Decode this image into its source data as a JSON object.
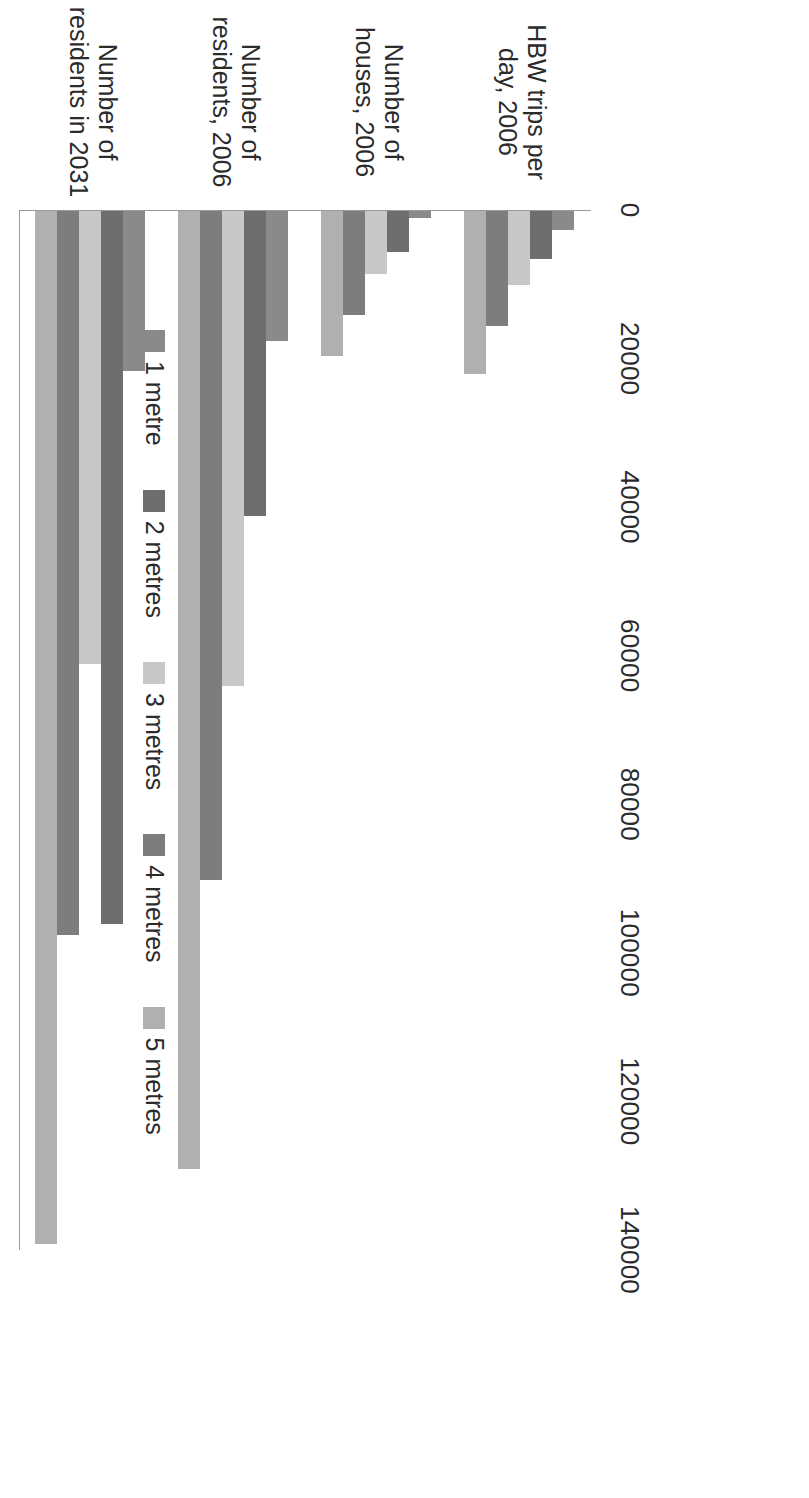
{
  "chart_data": {
    "type": "bar",
    "orientation": "vertical-clustered",
    "title": "",
    "subtitle": "",
    "xlabel": "",
    "ylabel": "",
    "ylim": [
      0,
      140000
    ],
    "grid": false,
    "legend_position": "bottom",
    "tick_labels": [
      "0",
      "20000",
      "40000",
      "60000",
      "80000",
      "100000",
      "120000",
      "140000"
    ],
    "ticks": [
      0,
      20000,
      40000,
      60000,
      80000,
      100000,
      120000,
      140000
    ],
    "categories": [
      "HBW trips per day, 2006",
      "Number of houses, 2006",
      "Number of residents, 2006",
      "Number of residents in 2031"
    ],
    "series": [
      {
        "name": "1 metre",
        "color": "#8a8a8a",
        "values": [
          2500,
          1000,
          17500,
          21500
        ]
      },
      {
        "name": "2 metres",
        "color": "#6e6e6e",
        "values": [
          6500,
          5500,
          41000,
          96000
        ]
      },
      {
        "name": "3 metres",
        "color": "#c8c8c8",
        "values": [
          10000,
          8500,
          64000,
          61000
        ]
      },
      {
        "name": "4 metres",
        "color": "#7d7d7d",
        "values": [
          15500,
          14000,
          90000,
          97500
        ]
      },
      {
        "name": "5 metres",
        "color": "#b0b0b0",
        "values": [
          22000,
          19500,
          129000,
          139000
        ]
      }
    ]
  },
  "legend": {
    "items": [
      {
        "label": "1 metre",
        "color": "#8a8a8a"
      },
      {
        "label": "2 metres",
        "color": "#6e6e6e"
      },
      {
        "label": "3 metres",
        "color": "#c8c8c8"
      },
      {
        "label": "4 metres",
        "color": "#7d7d7d"
      },
      {
        "label": "5 metres",
        "color": "#b0b0b0"
      }
    ]
  },
  "axis": {
    "line_color": "#9a9a9a"
  }
}
